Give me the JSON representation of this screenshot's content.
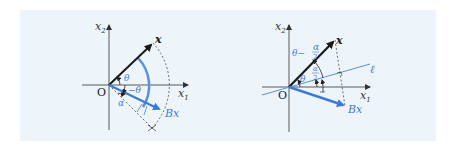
{
  "colors": {
    "panel_bg": "#eef5fa",
    "axis": "#333333",
    "vector_x": "#1a1a1a",
    "vector_bx": "#3a7bd5",
    "accent_label": "#4a7fd0"
  },
  "left_diagram": {
    "axis_x1": {
      "base": "x",
      "sub": "1"
    },
    "axis_x2": {
      "base": "x",
      "sub": "2"
    },
    "origin": "O",
    "vector_x_label": "x",
    "vector_bx_label": "Bx",
    "angle_theta": "θ",
    "angle_neg_theta": "−θ",
    "angle_alpha": "α"
  },
  "right_diagram": {
    "axis_x1": {
      "base": "x",
      "sub": "1"
    },
    "axis_x2": {
      "base": "x",
      "sub": "2"
    },
    "origin": "O",
    "vector_x_label": "x",
    "vector_bx_label": "Bx",
    "line_label": "ℓ",
    "angle_theta": "θ",
    "angle_theta_minus": "θ−",
    "frac_num": "α",
    "frac_den": "2"
  }
}
